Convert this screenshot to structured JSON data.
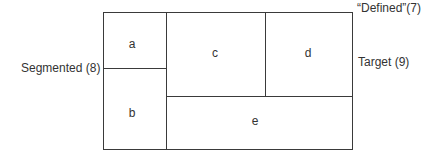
{
  "diagram": {
    "cells": {
      "a": "a",
      "b": "b",
      "c": "c",
      "d": "d",
      "e": "e"
    },
    "labels": {
      "left": "Segmented (8)",
      "top_right": "“Defined”(7)",
      "right": "Target (9)"
    }
  }
}
